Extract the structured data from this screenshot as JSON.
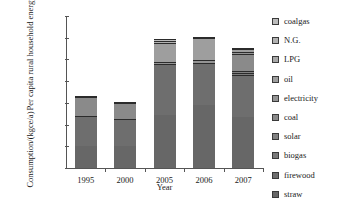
{
  "chart_data": {
    "type": "bar",
    "title": "",
    "subtitle": "",
    "xlabel": "Year",
    "ylabel": "Consumption/(kgce/a)",
    "ylabel_line2": "Per capita rural household energy",
    "ylim": [
      0,
      700
    ],
    "yticks": [
      0,
      100,
      200,
      300,
      400,
      500,
      600,
      700
    ],
    "grid": false,
    "stacked": true,
    "legend_position": "right",
    "categories": [
      "1995",
      "2000",
      "2005",
      "2006",
      "2007"
    ],
    "series": [
      {
        "name": "straw",
        "color": "#676767",
        "values": [
          103,
          103,
          243,
          290,
          235
        ]
      },
      {
        "name": "firewood",
        "color": "#6e6e6e",
        "values": [
          137,
          124,
          235,
          195,
          192
        ]
      },
      {
        "name": "biogas",
        "color": "#7a7a7a",
        "values": [
          0,
          0,
          0,
          0,
          10
        ]
      },
      {
        "name": "solar",
        "color": "#828282",
        "values": [
          0,
          0,
          0,
          0,
          12
        ]
      },
      {
        "name": "coal",
        "color": "#8a8a8a",
        "values": [
          88,
          73,
          0,
          0,
          74
        ]
      },
      {
        "name": "electricity",
        "color": "#949494",
        "values": [
          0,
          0,
          12,
          12,
          10
        ]
      },
      {
        "name": "oil",
        "color": "#9e9e9e",
        "values": [
          0,
          0,
          88,
          100,
          15
        ]
      },
      {
        "name": "LPG",
        "color": "#a8a8a8",
        "values": [
          0,
          0,
          0,
          0,
          6
        ]
      },
      {
        "name": "N.G.",
        "color": "#b2b2b2",
        "values": [
          5,
          2,
          9,
          4,
          0
        ]
      },
      {
        "name": "coalgas",
        "color": "#bcbcbc",
        "values": [
          0,
          0,
          6,
          4,
          0
        ]
      }
    ],
    "totals": [
      333,
      302,
      593,
      605,
      548
    ]
  },
  "legend": {
    "items": [
      {
        "label": "coalgas",
        "color": "#bcbcbc"
      },
      {
        "label": "N.G.",
        "color": "#b2b2b2"
      },
      {
        "label": "LPG",
        "color": "#a8a8a8"
      },
      {
        "label": "oil",
        "color": "#9e9e9e"
      },
      {
        "label": "electricity",
        "color": "#949494"
      },
      {
        "label": "coal",
        "color": "#8a8a8a"
      },
      {
        "label": "solar",
        "color": "#828282"
      },
      {
        "label": "biogas",
        "color": "#7a7a7a"
      },
      {
        "label": "firewood",
        "color": "#6e6e6e"
      },
      {
        "label": "straw",
        "color": "#676767"
      }
    ]
  }
}
